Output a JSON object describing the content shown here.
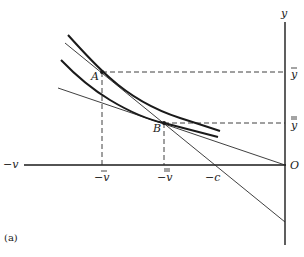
{
  "figure": {
    "panel_label": "(a)",
    "axes": {
      "x_axis_label": "−v",
      "y_axis_label": "y",
      "origin_label": "O"
    },
    "x_ticks": [
      {
        "label": "−v",
        "bar": "single",
        "x": 102
      },
      {
        "label": "−v",
        "bar": "double",
        "x": 165
      },
      {
        "label": "−c",
        "bar": "none",
        "x": 213
      }
    ],
    "y_ticks": [
      {
        "label": "y",
        "bar": "single",
        "y": 72
      },
      {
        "label": "y",
        "bar": "double",
        "y": 123
      }
    ],
    "points": [
      {
        "label": "A",
        "x": 102,
        "y": 72
      },
      {
        "label": "B",
        "x": 164,
        "y": 123
      }
    ],
    "curves": [
      {
        "name": "upper-indifference-curve",
        "through": "A"
      },
      {
        "name": "lower-indifference-curve",
        "through": "B"
      }
    ],
    "lines": [
      {
        "name": "steep-budget-line",
        "through": [
          "A",
          "B"
        ],
        "x_intercept": "−c"
      },
      {
        "name": "shallow-budget-line",
        "through": [
          "B",
          "O"
        ]
      }
    ],
    "colors": {
      "ink": "#1a1a1a",
      "background": "#ffffff"
    }
  }
}
